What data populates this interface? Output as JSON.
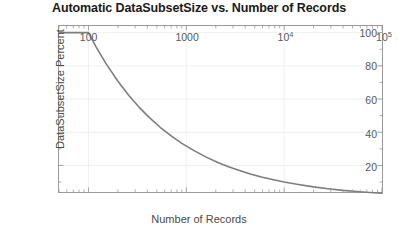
{
  "chart_data": {
    "type": "line",
    "title": "Automatic DataSubsetSize vs. Number of Records",
    "xlabel": "Number of Records",
    "ylabel": "DataSubsetSize Percent",
    "xscale": "log",
    "yscale": "linear",
    "xlim": [
      50,
      100000
    ],
    "ylim": [
      4,
      104
    ],
    "grid": true,
    "legend": null,
    "xticks": [
      {
        "value": 100,
        "label": "100"
      },
      {
        "value": 1000,
        "label": "1000"
      },
      {
        "value": 10000,
        "label": "10",
        "exponent": "4"
      },
      {
        "value": 100000,
        "label": "10",
        "exponent": "5"
      }
    ],
    "yticks": [
      {
        "value": 20,
        "label": "20"
      },
      {
        "value": 40,
        "label": "40"
      },
      {
        "value": 60,
        "label": "60"
      },
      {
        "value": 80,
        "label": "80"
      },
      {
        "value": 100,
        "label": "100"
      }
    ],
    "series": [
      {
        "name": "Automatic DataSubsetSize",
        "color": "#7d7d7d",
        "linewidth": 1.6,
        "x": [
          50,
          60,
          70,
          80,
          90,
          100,
          120,
          150,
          200,
          260,
          330,
          420,
          540,
          700,
          900,
          1200,
          1600,
          2100,
          2700,
          3500,
          4600,
          6000,
          8000,
          10000,
          14000,
          20000,
          28000,
          40000,
          55000,
          75000,
          100000
        ],
        "y": [
          100,
          100,
          100,
          100,
          100,
          100,
          91.3,
          81.6,
          70.7,
          62.0,
          55.0,
          48.8,
          43.0,
          37.8,
          33.3,
          28.9,
          25.0,
          21.8,
          19.2,
          16.9,
          14.7,
          12.9,
          11.2,
          10.0,
          8.5,
          7.1,
          6.0,
          5.0,
          4.3,
          3.7,
          3.2
        ]
      }
    ],
    "colors": {
      "line": "#7d7d7d",
      "axis": "#9a9a9a",
      "grid": "#f0f0f0",
      "title": "#1a1a1a",
      "tick_text": "#585858",
      "axis_label": "#4a4a4a",
      "background": "#ffffff"
    }
  }
}
